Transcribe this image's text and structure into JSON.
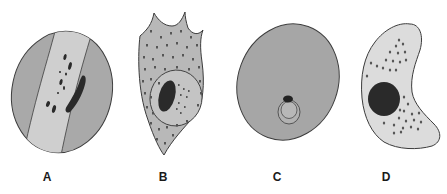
{
  "figure": {
    "type": "cell-illustrations",
    "panels": [
      {
        "id": "A",
        "label": "A",
        "x": 47,
        "description": "oval cell with light diagonal band, dark granules and elongated dark nucleus"
      },
      {
        "id": "B",
        "label": "B",
        "x": 163,
        "description": "irregular spiky cell with dotted cytoplasm, inner vacuole ring and dark oval nucleus"
      },
      {
        "id": "C",
        "label": "C",
        "x": 277,
        "description": "large round gray cell with small ring and dark spot near bottom"
      },
      {
        "id": "D",
        "label": "D",
        "x": 386,
        "description": "crescent-shaped light cell with large dark round nucleus and scattered granules"
      }
    ]
  },
  "colors": {
    "background": "#ffffff",
    "cell_gray": "#a9a9a9",
    "cell_light": "#cfcfcf",
    "cell_pale": "#dcdcdc",
    "outline": "#3c3c3c",
    "nucleus": "#2a2a2a",
    "label": "#1a1a1a"
  }
}
